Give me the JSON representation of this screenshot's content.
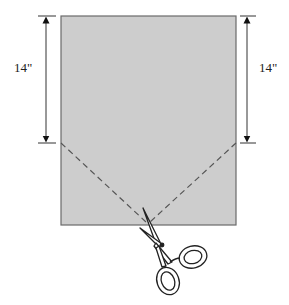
{
  "diagram": {
    "left_dimension": {
      "label": "14\""
    },
    "right_dimension": {
      "label": "14\""
    },
    "fabric": {
      "fill": "#cdcdcd",
      "stroke": "#555555"
    },
    "cut_lines": {
      "style": "dashed",
      "color": "#555555"
    },
    "tool": {
      "name": "scissors"
    }
  }
}
